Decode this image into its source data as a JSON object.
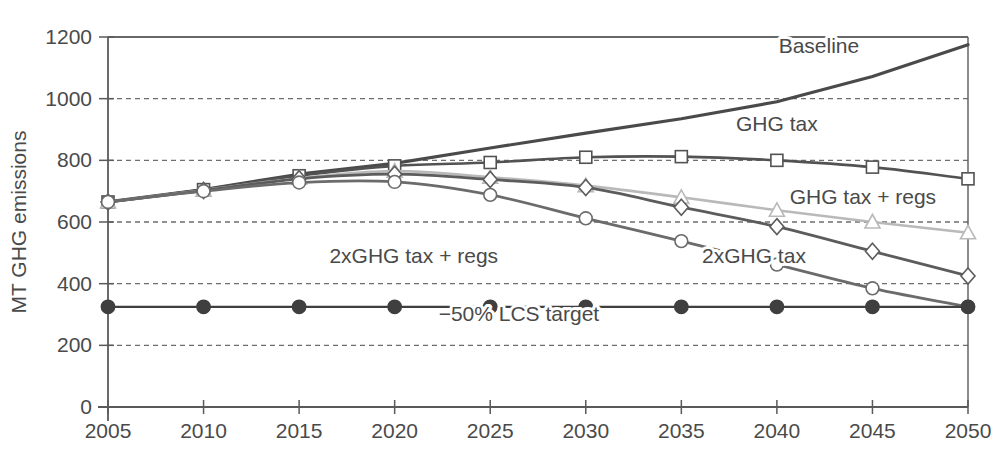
{
  "chart_data": {
    "type": "line",
    "title": "",
    "xlabel": "",
    "ylabel": "MT GHG emissions",
    "x": [
      2005,
      2010,
      2015,
      2020,
      2025,
      2030,
      2035,
      2040,
      2045,
      2050
    ],
    "xticklabels": [
      "2005",
      "2010",
      "2015",
      "2020",
      "2025",
      "2030",
      "2035",
      "2040",
      "2045",
      "2050"
    ],
    "yticklabels": [
      "0",
      "200",
      "400",
      "600",
      "800",
      "1000",
      "1200"
    ],
    "yticks": [
      0,
      200,
      400,
      600,
      800,
      1000,
      1200
    ],
    "xlim": [
      2005,
      2050
    ],
    "ylim": [
      0,
      1200
    ],
    "grid": "horizontal-dashed",
    "legend_position": "inline-annotations",
    "series": [
      {
        "name": "Baseline",
        "label": "Baseline",
        "marker": "none",
        "color": "#4a4a4a",
        "width": 3.2,
        "label_x": 2042.2,
        "label_y": 1148,
        "label_anchor": "middle",
        "values": [
          665,
          705,
          755,
          790,
          840,
          888,
          935,
          990,
          1072,
          1175
        ]
      },
      {
        "name": "GHG tax",
        "label": "GHG tax",
        "marker": "square",
        "color": "#525252",
        "width": 2.6,
        "label_x": 2040.0,
        "label_y": 895,
        "label_anchor": "middle",
        "values": [
          665,
          705,
          750,
          782,
          793,
          810,
          812,
          800,
          778,
          740
        ]
      },
      {
        "name": "GHG tax + regs",
        "label": "GHG tax + regs",
        "marker": "triangle",
        "color": "#b9b9b9",
        "width": 2.6,
        "label_x": 2044.5,
        "label_y": 660,
        "label_anchor": "middle",
        "values": [
          665,
          703,
          742,
          765,
          745,
          718,
          680,
          638,
          600,
          565
        ]
      },
      {
        "name": "2xGHG tax",
        "label": "2xGHG tax",
        "marker": "diamond",
        "color": "#5c5c5c",
        "width": 2.8,
        "label_x": 2038.8,
        "label_y": 468,
        "label_anchor": "middle",
        "values": [
          665,
          702,
          740,
          755,
          738,
          712,
          648,
          585,
          505,
          425
        ]
      },
      {
        "name": "2xGHG tax + regs",
        "label": "2xGHG tax + regs",
        "marker": "circle",
        "color": "#6b6b6b",
        "width": 2.8,
        "label_x": 2021.0,
        "label_y": 468,
        "label_anchor": "middle",
        "values": [
          665,
          700,
          728,
          730,
          688,
          612,
          538,
          462,
          385,
          325
        ]
      },
      {
        "name": "-50% LCS target",
        "label": "−50% LCS target",
        "marker": "filled-circle",
        "color": "#3f3f3f",
        "width": 2.2,
        "label_x": 2026.5,
        "label_y": 278,
        "label_anchor": "middle",
        "values": [
          325,
          325,
          325,
          325,
          325,
          325,
          325,
          325,
          325,
          325
        ]
      }
    ]
  },
  "style": {
    "axis_color": "#5a5a5a",
    "grid_color": "#6e6e6e",
    "background": "#ffffff",
    "text_color": "#4a4a4a"
  }
}
